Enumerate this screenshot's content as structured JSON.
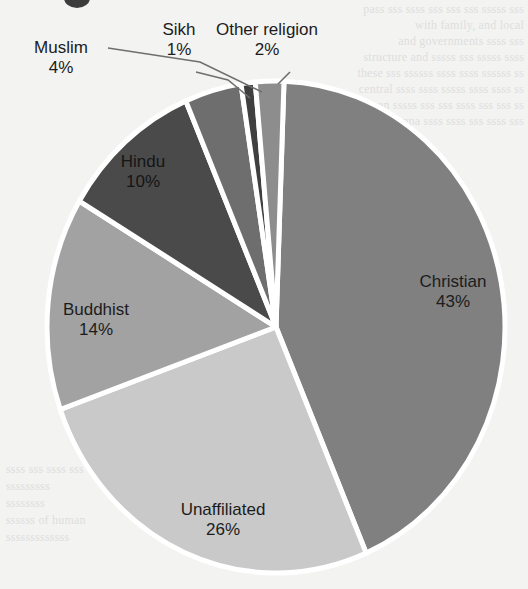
{
  "figure": {
    "background_color": "#f3f3f1",
    "separator_color": "#ffffff",
    "title_fragment": "clipped-title-glyph"
  },
  "bleed_through_text": {
    "note": "faint mirrored text from the reverse of the scanned page",
    "lines_top": [
      "pass sss ssss sss sss sss sssss sss",
      "with family, and local",
      "and governments ssss sss",
      "structure and sssss sss sssss ssss",
      "these sss ssssss ssss ssss ssssss ss",
      "central ssss ssss sssss ssss ssss ss",
      "even sssss sss sss ssss sss sss ss",
      "compa ssss ssss sss ssss sss"
    ],
    "lines_bottom": [
      "ssss sss ssss sss",
      "sssssssss",
      "ssssssss",
      "ssssss of human",
      "sssssssssssss"
    ]
  },
  "chart_data": {
    "type": "pie",
    "title": "",
    "categories": [
      "Christian",
      "Unaffiliated",
      "Buddhist",
      "Hindu",
      "Muslim",
      "Sikh",
      "Other religion"
    ],
    "values": [
      43,
      26,
      14,
      10,
      4,
      1,
      2
    ],
    "value_suffix": "%",
    "legend": "none (direct labels with leader lines)",
    "total": 100,
    "start_angle_deg": -88,
    "direction": "clockwise",
    "slice_colors": [
      "#808080",
      "#c9c9c9",
      "#a2a2a2",
      "#4a4a4a",
      "#6e6e6e",
      "#3f3f3f",
      "#8d8d8d"
    ],
    "slices": [
      {
        "label": "Christian",
        "value": 43,
        "display": "43%",
        "color": "#808080",
        "label_position": "inside",
        "label_color": "#1c1c1c"
      },
      {
        "label": "Unaffiliated",
        "value": 26,
        "display": "26%",
        "color": "#c9c9c9",
        "label_position": "inside",
        "label_color": "#1c1c1c"
      },
      {
        "label": "Buddhist",
        "value": 14,
        "display": "14%",
        "color": "#a2a2a2",
        "label_position": "inside",
        "label_color": "#1c1c1c"
      },
      {
        "label": "Hindu",
        "value": 10,
        "display": "10%",
        "color": "#4a4a4a",
        "label_position": "inside",
        "label_color": "#151515"
      },
      {
        "label": "Muslim",
        "value": 4,
        "display": "4%",
        "color": "#6e6e6e",
        "label_position": "outside-left",
        "leader_line": true
      },
      {
        "label": "Sikh",
        "value": 1,
        "display": "1%",
        "color": "#3f3f3f",
        "label_position": "outside-top",
        "leader_line": true
      },
      {
        "label": "Other religion",
        "value": 2,
        "display": "2%",
        "color": "#8d8d8d",
        "label_position": "outside-top",
        "leader_line": true
      }
    ]
  },
  "labels": {
    "christian": {
      "name": "Christian",
      "pct": "43%"
    },
    "unaffiliated": {
      "name": "Unaffiliated",
      "pct": "26%"
    },
    "buddhist": {
      "name": "Buddhist",
      "pct": "14%"
    },
    "hindu": {
      "name": "Hindu",
      "pct": "10%"
    },
    "muslim": {
      "name": "Muslim",
      "pct": "4%"
    },
    "sikh": {
      "name": "Sikh",
      "pct": "1%"
    },
    "other": {
      "name": "Other religion",
      "pct": "2%"
    }
  }
}
